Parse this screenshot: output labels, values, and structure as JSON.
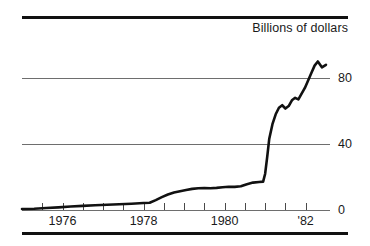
{
  "header": {
    "title": "Billions of dollars"
  },
  "chart_data": {
    "type": "line",
    "title": "Billions of dollars",
    "xlabel": "",
    "ylabel": "Billions of dollars",
    "xlim": [
      1975.0,
      1982.6
    ],
    "ylim": [
      0,
      100
    ],
    "grid": true,
    "gridlines": [
      0,
      40,
      80
    ],
    "legend": null,
    "y_ticks": [
      {
        "value": 80,
        "label": "80"
      },
      {
        "value": 40,
        "label": "40"
      },
      {
        "value": 0,
        "label": "0"
      }
    ],
    "x_ticks": [
      {
        "value": 1975.5,
        "label": ""
      },
      {
        "value": 1976.0,
        "label": "1976"
      },
      {
        "value": 1976.5,
        "label": ""
      },
      {
        "value": 1977.0,
        "label": ""
      },
      {
        "value": 1977.5,
        "label": ""
      },
      {
        "value": 1978.0,
        "label": "1978"
      },
      {
        "value": 1978.5,
        "label": ""
      },
      {
        "value": 1979.0,
        "label": ""
      },
      {
        "value": 1979.5,
        "label": ""
      },
      {
        "value": 1980.0,
        "label": "1980"
      },
      {
        "value": 1980.5,
        "label": ""
      },
      {
        "value": 1981.0,
        "label": ""
      },
      {
        "value": 1981.5,
        "label": ""
      },
      {
        "value": 1982.0,
        "label": "'82"
      }
    ],
    "x_tick_labels": [
      "1976",
      "1978",
      "1980",
      "'82"
    ],
    "series": [
      {
        "name": "value",
        "color": "#111111",
        "x": [
          1975.0,
          1975.3,
          1975.6,
          1975.9,
          1976.2,
          1976.5,
          1976.8,
          1977.1,
          1977.4,
          1977.7,
          1978.0,
          1978.15,
          1978.3,
          1978.45,
          1978.6,
          1978.75,
          1978.9,
          1979.05,
          1979.2,
          1979.35,
          1979.5,
          1979.65,
          1979.8,
          1979.95,
          1980.1,
          1980.25,
          1980.4,
          1980.55,
          1980.7,
          1980.85,
          1980.95,
          1981.0,
          1981.05,
          1981.1,
          1981.18,
          1981.26,
          1981.34,
          1981.42,
          1981.5,
          1981.58,
          1981.66,
          1981.74,
          1981.82,
          1981.9,
          1981.98,
          1982.06,
          1982.14,
          1982.22,
          1982.3,
          1982.4,
          1982.5
        ],
        "y": [
          0.6,
          0.8,
          1.2,
          1.6,
          2.1,
          2.5,
          2.9,
          3.2,
          3.5,
          3.8,
          4.2,
          4.4,
          6.0,
          7.8,
          9.4,
          10.6,
          11.4,
          12.1,
          12.8,
          13.2,
          13.3,
          13.2,
          13.4,
          13.8,
          14.1,
          14.0,
          14.4,
          15.6,
          16.6,
          17.0,
          17.2,
          22.0,
          32.0,
          43.0,
          52.0,
          58.0,
          62.0,
          63.5,
          61.5,
          63.0,
          66.5,
          68.0,
          67.0,
          70.5,
          74.0,
          78.5,
          83.0,
          87.5,
          90.0,
          86.5,
          88.0
        ]
      }
    ]
  }
}
